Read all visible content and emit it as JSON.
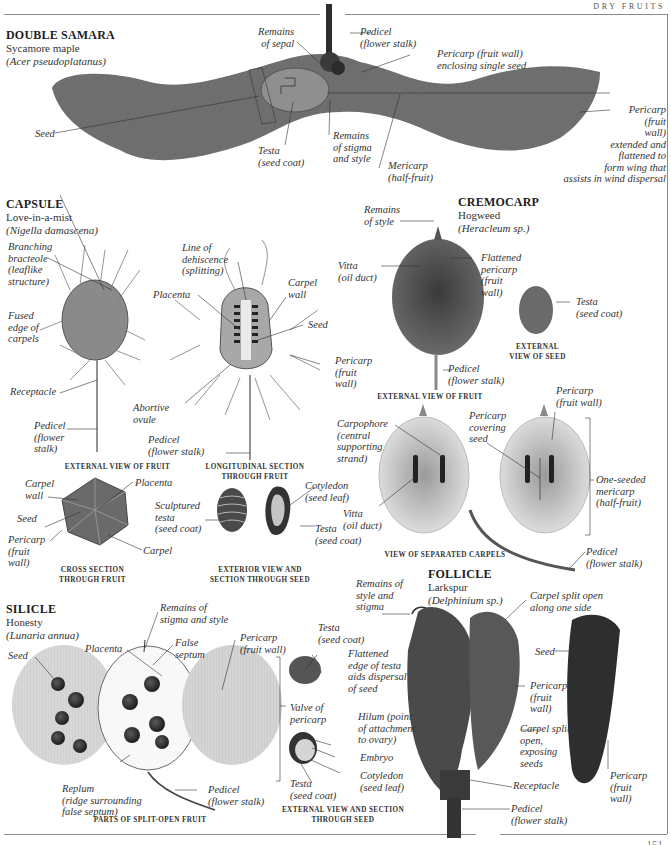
{
  "header": {
    "section_title": "DRY FRUITS"
  },
  "page_number": "151",
  "sections": {
    "double_samara": {
      "type": "DOUBLE SAMARA",
      "common_name": "Sycamore maple",
      "latin_name": "(Acer pseudoplatanus)",
      "labels": {
        "seed": "Seed",
        "remains_of_sepal": "Remains\nof sepal",
        "testa": "Testa\n(seed coat)",
        "pedicel": "Pedicel\n(flower stalk)",
        "pericarp_enclosing": "Pericarp (fruit wall)\nenclosing single seed",
        "remains_stigma_style": "Remains\nof stigma\nand style",
        "mericarp": "Mericarp\n(half-fruit)",
        "pericarp_wing": "Pericarp\n(fruit\nwall)\nextended and\nflattened to\nform wing that\nassists in wind dispersal"
      }
    },
    "capsule": {
      "type": "CAPSULE",
      "common_name": "Love-in-a-mist",
      "latin_name": "(Nigella damascena)",
      "labels": {
        "branching_bracteole": "Branching\nbracteole\n(leaflike\nstructure)",
        "fused_edge": "Fused\nedge of\ncarpels",
        "receptacle": "Receptacle",
        "pedicel_ext": "Pedicel\n(flower\nstalk)",
        "line_of_dehiscence": "Line of\ndehiscence\n(splitting)",
        "placenta": "Placenta",
        "carpel_wall": "Carpel\nwall",
        "seed": "Seed",
        "pericarp": "Pericarp\n(fruit\nwall)",
        "abortive_ovule": "Abortive\novule",
        "pedicel_long": "Pedicel\n(flower stalk)",
        "cs_carpel_wall": "Carpel\nwall",
        "cs_placenta": "Placenta",
        "cs_seed": "Seed",
        "cs_pericarp": "Pericarp\n(fruit\nwall)",
        "cs_carpel": "Carpel",
        "sculptured_testa": "Sculptured\ntesta\n(seed coat)",
        "cotyledon": "Cotyledon\n(seed leaf)",
        "testa": "Testa\n(seed coat)"
      },
      "captions": {
        "external_view": "EXTERNAL VIEW OF FRUIT",
        "longitudinal_section": "LONGITUDINAL SECTION\nTHROUGH FRUIT",
        "cross_section": "CROSS SECTION\nTHROUGH FRUIT",
        "exterior_seed": "EXTERIOR VIEW AND\nSECTION THROUGH SEED"
      }
    },
    "cremocarp": {
      "type": "CREMOCARP",
      "common_name": "Hogweed",
      "latin_name": "(Heracleum sp.)",
      "labels": {
        "remains_of_style": "Remains\nof style",
        "vitta": "Vitta\n(oil duct)",
        "flattened_pericarp": "Flattened\npericarp\n(fruit\nwall)",
        "testa": "Testa\n(seed coat)",
        "pedicel": "Pedicel\n(flower stalk)",
        "carpophore": "Carpophore\n(central\nsupporting\nstrand)",
        "vitta_sep": "Vitta\n(oil duct)",
        "pericarp_covering": "Pericarp\ncovering\nseed",
        "pericarp_fruit_wall": "Pericarp\n(fruit wall)",
        "one_seeded_mericarp": "One-seeded\nmericarp\n(half-fruit)",
        "pedicel_sep": "Pedicel\n(flower stalk)"
      },
      "captions": {
        "external_seed": "EXTERNAL\nVIEW OF SEED",
        "external_fruit": "EXTERNAL VIEW OF FRUIT",
        "separated_carpels": "VIEW OF SEPARATED CARPELS"
      }
    },
    "silicle": {
      "type": "SILICLE",
      "common_name": "Honesty",
      "latin_name": "(Lunaria annua)",
      "labels": {
        "seed": "Seed",
        "placenta": "Placenta",
        "remains_stigma_style": "Remains of\nstigma and style",
        "false_septum": "False\nseptum",
        "pericarp": "Pericarp\n(fruit wall)",
        "replum": "Replum\n(ridge surrounding\nfalse septum)",
        "pedicel": "Pedicel\n(flower stalk)",
        "valve_of_pericarp": "Valve of\npericarp",
        "testa_top": "Testa\n(seed coat)",
        "flattened_edge": "Flattened\nedge of testa\naids dispersal\nof seed",
        "hilum": "Hilum (point\nof attachment\nto ovary)",
        "embryo": "Embryo",
        "cotyledon": "Cotyledon\n(seed leaf)",
        "testa_bottom": "Testa\n(seed coat)"
      },
      "captions": {
        "split_open": "PARTS OF SPLIT-OPEN FRUIT",
        "external_seed": "EXTERNAL VIEW AND SECTION\nTHROUGH SEED"
      }
    },
    "follicle": {
      "type": "FOLLICLE",
      "common_name": "Larkspur",
      "latin_name": "(Delphinium sp.)",
      "labels": {
        "remains_style_stigma": "Remains of\nstyle and\nstigma",
        "carpel_split_side": "Carpel split open\nalong one side",
        "seed": "Seed",
        "pericarp_mid": "Pericarp\n(fruit\nwall)",
        "carpel_split_exposing": "Carpel split\nopen,\nexposing\nseeds",
        "receptacle": "Receptacle",
        "pedicel": "Pedicel\n(flower stalk)",
        "pericarp_right": "Pericarp\n(fruit\nwall)"
      }
    }
  },
  "colors": {
    "rule": "#8a8a8a",
    "specimen_dark": "#4a4a4a",
    "specimen_mid": "#7a7a7a",
    "specimen_light": "#c9c9c9"
  }
}
